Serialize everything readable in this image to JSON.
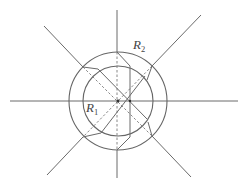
{
  "diagram": {
    "labels": {
      "r1": {
        "main": "R",
        "sub": "1"
      },
      "r2": {
        "main": "R",
        "sub": "2"
      }
    },
    "colors": {
      "line": "#6a6a6a",
      "dashed": "#7a7a7a",
      "background": "#ffffff"
    },
    "center_a": [
      118,
      101
    ],
    "center_b": [
      130,
      101
    ],
    "outer_circle_radius": 49,
    "inner_circle_radius": 35,
    "rays": [
      "top",
      "top-right",
      "right",
      "bottom-right",
      "bottom",
      "bottom-left",
      "left",
      "top-left"
    ]
  }
}
